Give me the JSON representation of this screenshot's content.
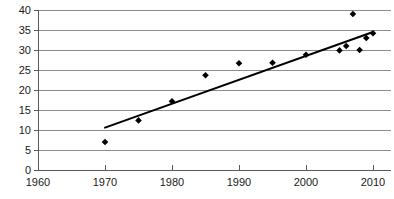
{
  "chart_data": {
    "type": "scatter",
    "title": "",
    "subtitle": "",
    "xlabel": "",
    "ylabel": "",
    "xlim": [
      1960,
      2010
    ],
    "ylim": [
      0,
      40
    ],
    "xticks": [
      1960,
      1970,
      1980,
      1990,
      2000,
      2010
    ],
    "yticks": [
      0,
      5,
      10,
      15,
      20,
      25,
      30,
      35,
      40
    ],
    "xtick_labels": [
      "1960",
      "1970",
      "1980",
      "1990",
      "2000",
      "2010"
    ],
    "ytick_labels": [
      "0",
      "5",
      "10",
      "15",
      "20",
      "25",
      "30",
      "35",
      "40"
    ],
    "grid": "horizontal",
    "legend": "none",
    "marker": "diamond",
    "marker_color": "#000000",
    "gridline_color": "#8c8c8c",
    "axis_color": "#5a5a5a",
    "series": [
      {
        "name": "data",
        "type": "scatter",
        "points": [
          {
            "x": 1970,
            "y": 7.0
          },
          {
            "x": 1975,
            "y": 12.4
          },
          {
            "x": 1980,
            "y": 17.2
          },
          {
            "x": 1985,
            "y": 23.7
          },
          {
            "x": 1990,
            "y": 26.7
          },
          {
            "x": 1995,
            "y": 26.8
          },
          {
            "x": 2000,
            "y": 28.8
          },
          {
            "x": 2005,
            "y": 29.9
          },
          {
            "x": 2006,
            "y": 31.0
          },
          {
            "x": 2007,
            "y": 39.0
          },
          {
            "x": 2008,
            "y": 30.0
          },
          {
            "x": 2009,
            "y": 33.0
          },
          {
            "x": 2010,
            "y": 34.2
          }
        ]
      },
      {
        "name": "trendline",
        "type": "line",
        "points": [
          {
            "x": 1970,
            "y": 10.6
          },
          {
            "x": 2010,
            "y": 34.5
          }
        ]
      }
    ]
  },
  "plot_geometry": {
    "left": 38,
    "right": 373,
    "top": 10,
    "bottom": 170
  }
}
